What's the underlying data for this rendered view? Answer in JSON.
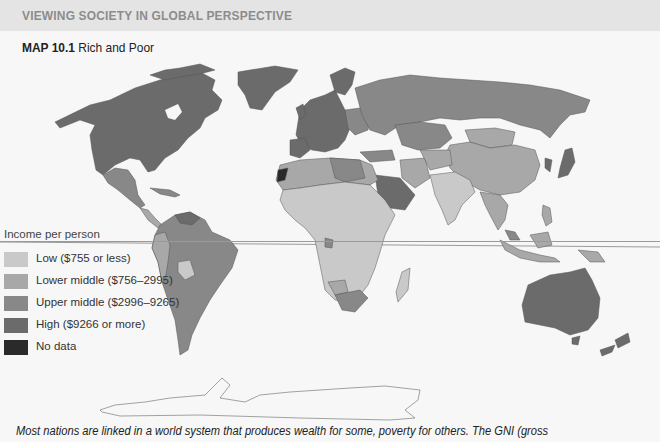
{
  "header": {
    "section_title": "VIEWING SOCIETY IN GLOBAL PERSPECTIVE"
  },
  "map": {
    "number": "MAP 10.1",
    "title": "Rich and Poor",
    "equator_line": true
  },
  "legend": {
    "title": "Income per person",
    "items": [
      {
        "label": "Low ($755 or less)",
        "color": "#c9c9c9"
      },
      {
        "label": "Lower middle ($756–2995)",
        "color": "#a8a8a8"
      },
      {
        "label": "Upper middle ($2996–9265)",
        "color": "#888888"
      },
      {
        "label": "High ($9266 or more)",
        "color": "#6b6b6b"
      },
      {
        "label": "No data",
        "color": "#2a2a2a"
      }
    ]
  },
  "caption": "Most nations are linked in a world system that produces wealth for some, poverty for others. The GNI (gross"
}
